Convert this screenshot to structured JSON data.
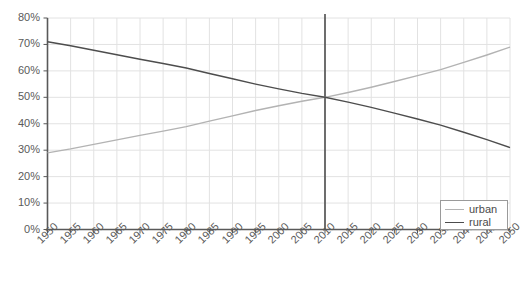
{
  "chart_data": {
    "type": "line",
    "title": "",
    "xlabel": "",
    "ylabel": "",
    "grid": true,
    "legend_position": "bottom-right",
    "xlim": [
      1950,
      2050
    ],
    "ylim": [
      0,
      80
    ],
    "x": [
      1950,
      1955,
      1960,
      1965,
      1970,
      1975,
      1980,
      1985,
      1990,
      1995,
      2000,
      2005,
      2010,
      2015,
      2020,
      2025,
      2030,
      2035,
      2040,
      2045,
      2050
    ],
    "x_tick_labels": [
      "1950",
      "1955",
      "1960",
      "1965",
      "1970",
      "1975",
      "1980",
      "1985",
      "1990",
      "1995",
      "2000",
      "2005",
      "2010",
      "2015",
      "2020",
      "2025",
      "2030",
      "2035",
      "2040",
      "2045",
      "2050"
    ],
    "y_tick_labels": [
      "0%",
      "10%",
      "20%",
      "30%",
      "40%",
      "50%",
      "60%",
      "70%",
      "80%"
    ],
    "y_ticks": [
      0,
      10,
      20,
      30,
      40,
      50,
      60,
      70,
      80
    ],
    "series": [
      {
        "name": "urban",
        "color": "#b3b3b3",
        "values": [
          29,
          30.5,
          32.2,
          33.9,
          35.6,
          37.2,
          38.9,
          41,
          43,
          45,
          46.8,
          48.5,
          50,
          51.8,
          53.8,
          56,
          58.2,
          60.5,
          63.2,
          66,
          69
        ]
      },
      {
        "name": "rural",
        "color": "#4d4d4d",
        "values": [
          71,
          69.5,
          67.8,
          66.1,
          64.4,
          62.8,
          61.1,
          59,
          57,
          55,
          53.2,
          51.5,
          50,
          48.2,
          46.2,
          44,
          41.8,
          39.5,
          36.8,
          34,
          31
        ]
      }
    ],
    "annotations": [
      {
        "type": "vertical-line",
        "x": 2010,
        "color": "#4d4d4d",
        "label": ""
      }
    ]
  },
  "legend": {
    "entries": [
      {
        "label": "urban",
        "color": "#b3b3b3"
      },
      {
        "label": "rural",
        "color": "#4d4d4d"
      }
    ]
  },
  "style": {
    "axis_color": "#595959",
    "grid_color": "#e2e2e2",
    "background": "#ffffff"
  }
}
